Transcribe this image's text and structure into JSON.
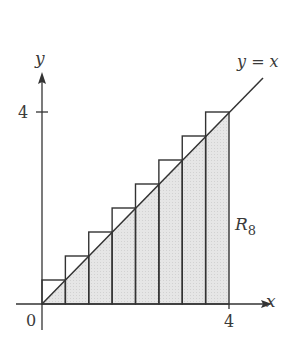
{
  "diagram": {
    "type": "riemann_sum_right_endpoints",
    "function_label": "y = x",
    "region_label": "R",
    "region_subscript": "8",
    "axes": {
      "x_label": "x",
      "y_label": "y",
      "origin_label": "0",
      "x_tick_label": "4",
      "y_tick_label": "4"
    },
    "n_rectangles": 8,
    "interval": [
      0,
      4
    ],
    "rectangle_heights": [
      0.5,
      1.0,
      1.5,
      2.0,
      2.5,
      3.0,
      3.5,
      4.0
    ],
    "colors": {
      "shade": "#e4e4e4",
      "stroke": "#333333",
      "background": "#ffffff"
    }
  }
}
